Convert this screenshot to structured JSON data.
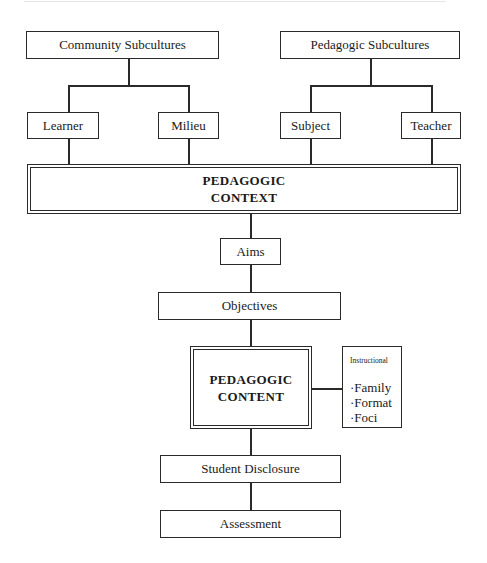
{
  "diagram": {
    "top_nodes": {
      "community": "Community Subcultures",
      "pedagogic": "Pedagogic Subcultures"
    },
    "sub_nodes": {
      "learner": "Learner",
      "milieu": "Milieu",
      "subject": "Subject",
      "teacher": "Teacher"
    },
    "context": {
      "line1": "PEDAGOGIC",
      "line2": "CONTEXT"
    },
    "aims": "Aims",
    "objectives": "Objectives",
    "content": {
      "line1": "PEDAGOGIC",
      "line2": "CONTENT"
    },
    "instructional": {
      "heading": "Instructional",
      "items": [
        "·Family",
        "·Format",
        "·Foci"
      ]
    },
    "student_disclosure": "Student Disclosure",
    "assessment": "Assessment"
  }
}
